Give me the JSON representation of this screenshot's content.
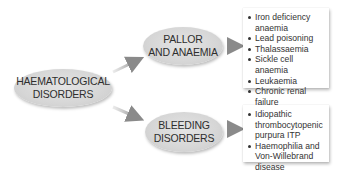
{
  "diagram": {
    "type": "flowchart",
    "root": {
      "line1": "HAEMATOLOGICAL",
      "line2": "DISORDERS"
    },
    "branches": [
      {
        "node": {
          "line1": "PALLOR",
          "line2": "AND ANAEMIA"
        },
        "items": [
          "Iron deficiency anaemia",
          "Lead poisoning",
          "Thalassaemia",
          "Sickle cell anaemia",
          "Leukaemia",
          "Chronic renal failure"
        ]
      },
      {
        "node": {
          "line1": "BLEEDING",
          "line2": "DISORDERS"
        },
        "items": [
          "Idiopathic thrombocytopenic purpura ITP",
          "Haemophilia and Von-Willebrand disease"
        ]
      }
    ],
    "colors": {
      "ellipse_fill": "#d6d6d6",
      "arrow": "#8c8c8c",
      "box_fill": "#ffffff",
      "text": "#2e2e2e"
    }
  }
}
